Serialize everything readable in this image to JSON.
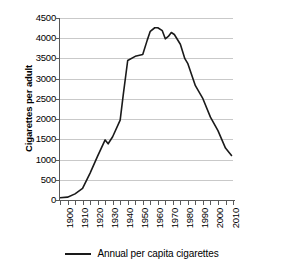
{
  "chart_data": {
    "type": "line",
    "title": "",
    "xlabel": "",
    "ylabel": "Cigarettes per adult",
    "xlim": [
      1900,
      2015
    ],
    "ylim": [
      0,
      4500
    ],
    "grid": true,
    "legend_position": "bottom",
    "y_ticks": [
      0,
      500,
      1000,
      1500,
      2000,
      2500,
      3000,
      3500,
      4000,
      4500
    ],
    "y_tick_labels": [
      "0",
      "500",
      "1000",
      "1500",
      "2000",
      "2500",
      "3000",
      "3500",
      "4000",
      "4500"
    ],
    "x_ticks": [
      1900,
      1910,
      1920,
      1930,
      1940,
      1950,
      1960,
      1970,
      1980,
      1990,
      2000,
      2010
    ],
    "x_tick_labels": [
      "1900",
      "1910",
      "1920",
      "1930",
      "1940",
      "1950",
      "1960",
      "1970",
      "1980",
      "1990",
      "2000",
      "2010"
    ],
    "x_minor_tick_step": 5,
    "series": [
      {
        "name": "Annual per capita cigarettes",
        "color": "#1a1a1a",
        "x": [
          1900,
          1905,
          1910,
          1915,
          1920,
          1925,
          1930,
          1932,
          1935,
          1940,
          1942,
          1945,
          1950,
          1955,
          1958,
          1960,
          1963,
          1965,
          1968,
          1970,
          1972,
          1974,
          1976,
          1980,
          1983,
          1985,
          1990,
          1995,
          2000,
          2005,
          2010,
          2014
        ],
        "y": [
          54,
          70,
          151,
          285,
          665,
          1085,
          1485,
          1390,
          1564,
          1976,
          2585,
          3449,
          3552,
          3597,
          3953,
          4171,
          4259,
          4258,
          4186,
          3985,
          4043,
          4141,
          4092,
          3851,
          3494,
          3370,
          2827,
          2505,
          2049,
          1716,
          1284,
          1100
        ]
      }
    ]
  },
  "legend": {
    "items": [
      {
        "label": "Annual per capita cigarettes",
        "color": "#1a1a1a"
      }
    ]
  }
}
